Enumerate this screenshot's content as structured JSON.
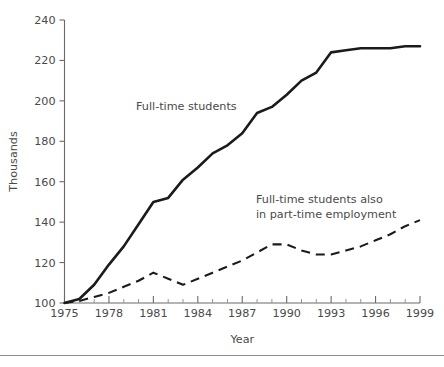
{
  "chart_data": {
    "type": "line",
    "title": "",
    "xlabel": "Year",
    "ylabel": "Thousands",
    "xlim": [
      1975,
      1999
    ],
    "ylim": [
      100,
      240
    ],
    "grid": false,
    "legend_position": "inline-annotations",
    "x_tick_labels": [
      "1975",
      "1978",
      "1981",
      "1984",
      "1987",
      "1990",
      "1993",
      "1996",
      "1999"
    ],
    "x_tick_values": [
      1975,
      1978,
      1981,
      1984,
      1987,
      1990,
      1993,
      1996,
      1999
    ],
    "x_minor_tick_values": [
      1976,
      1977,
      1979,
      1980,
      1982,
      1983,
      1985,
      1986,
      1988,
      1989,
      1991,
      1992,
      1994,
      1995,
      1997,
      1998
    ],
    "y_tick_labels": [
      "100",
      "120",
      "140",
      "160",
      "180",
      "200",
      "220",
      "240"
    ],
    "y_tick_values": [
      100,
      120,
      140,
      160,
      180,
      200,
      220,
      240
    ],
    "x": [
      1975,
      1976,
      1977,
      1978,
      1979,
      1980,
      1981,
      1982,
      1983,
      1984,
      1985,
      1986,
      1987,
      1988,
      1989,
      1990,
      1991,
      1992,
      1993,
      1994,
      1995,
      1996,
      1997,
      1998,
      1999
    ],
    "series": [
      {
        "name": "Full-time students",
        "style": "solid",
        "color": "#1b1b1b",
        "values": [
          100,
          102,
          109,
          119,
          128,
          139,
          150,
          152,
          161,
          167,
          174,
          178,
          184,
          194,
          197,
          203,
          210,
          214,
          224,
          225,
          226,
          226,
          226,
          227,
          227
        ]
      },
      {
        "name": "Full-time students also in part-time employment",
        "style": "dashed",
        "color": "#1b1b1b",
        "values": [
          100,
          101,
          103,
          105,
          108,
          111,
          115,
          112,
          109,
          112,
          115,
          118,
          121,
          125,
          129,
          129,
          126,
          124,
          124,
          126,
          128,
          131,
          134,
          138,
          141
        ]
      }
    ],
    "annotations": [
      {
        "id": "annotation-full-time-students",
        "lines": [
          "Full-time students"
        ],
        "x_px": 136,
        "y_px": 110
      },
      {
        "id": "annotation-part-time-employment",
        "lines": [
          "Full-time students also",
          "in part-time employment"
        ],
        "x_px": 256,
        "y_px": 203
      }
    ]
  }
}
